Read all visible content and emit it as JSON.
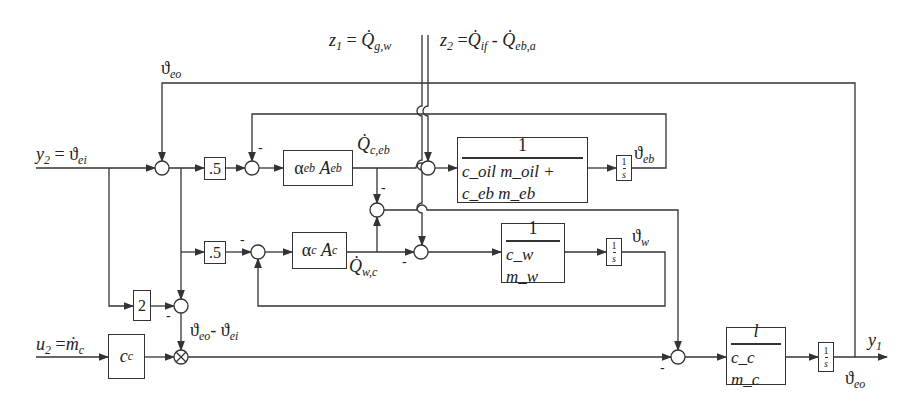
{
  "inputs": {
    "z1": {
      "name": "z",
      "sub": "1",
      "eq": "=",
      "rhs": "Q̇",
      "rhs_sub": "g,w"
    },
    "z2": {
      "name": "z",
      "sub": "2",
      "eq": "=",
      "rhs1": "Q̇",
      "rhs1_sub": "if",
      "minus": "-",
      "rhs2": "Q̇",
      "rhs2_sub": "eb,a"
    },
    "y2": {
      "name": "y",
      "sub": "2",
      "eq": "=",
      "rhs": "ϑ",
      "rhs_sub": "ei"
    },
    "u2": {
      "name": "u",
      "sub": "2",
      "eq": "=",
      "rhs": "ṁ",
      "rhs_sub": "c"
    }
  },
  "signals": {
    "theta_eo_top": {
      "sym": "ϑ",
      "sub": "eo"
    },
    "q_c_eb": {
      "sym": "Q̇",
      "sub": "c,eb"
    },
    "q_w_c": {
      "sym": "Q̇",
      "sub": "w,c"
    },
    "theta_eb": {
      "sym": "ϑ",
      "sub": "eb"
    },
    "theta_w": {
      "sym": "ϑ",
      "sub": "w"
    },
    "theta_diff": {
      "sym1": "ϑ",
      "sub1": "eo",
      "minus": "-",
      "sym2": "ϑ",
      "sub2": "ei"
    },
    "y1": {
      "sym": "y",
      "sub": "1"
    },
    "theta_eo_out": {
      "sym": "ϑ",
      "sub": "eo"
    }
  },
  "blocks": {
    "gain_half_top": ".5",
    "gain_half_bottom": ".5",
    "gain_two": "2",
    "alpha_eb": {
      "sym": "α",
      "sub1": "eb",
      "sym2": "A",
      "sub2": "eb"
    },
    "alpha_c": {
      "sym": "α",
      "sub1": "c",
      "sym2": "A",
      "sub2": "c"
    },
    "oil_block": {
      "num": "1",
      "den": "c_oil m_oil + c_eb m_eb"
    },
    "water_block": {
      "num": "1",
      "den": "c_w  m_w"
    },
    "cc_gain": {
      "sym": "c",
      "sub": "c"
    },
    "cc_mc_block": {
      "num": "l",
      "den": "c_c m_c"
    },
    "integrator": {
      "num": "1",
      "den": "s"
    }
  },
  "sign_labels": {
    "minus": "-"
  }
}
